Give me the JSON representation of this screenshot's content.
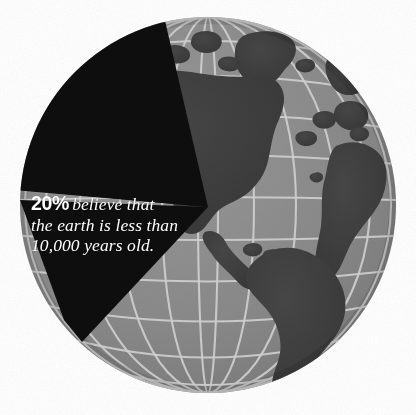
{
  "figure": {
    "name": "globe-pie-infographic",
    "background_color": "#ffffff",
    "globe": {
      "center_x": 208,
      "center_y": 205,
      "radius": 188,
      "ocean_color": "#8a8a8a",
      "land_color": "#3f3f3f",
      "grid_color": "#d2d2d2",
      "grid_meridians": 12,
      "grid_parallels": 11,
      "label": "Earth globe centered on the Americas"
    },
    "wedge": {
      "label": "20% pie wedge",
      "color": "#0e0e0e",
      "percent_value": 20,
      "apex_x": 208,
      "apex_y": 207,
      "start_angle_deg": 185,
      "end_angle_deg": 257
    }
  },
  "callout": {
    "percent": "20%",
    "line1_rest": "believe that",
    "line2": "the earth is less than",
    "line3": "10,000 years old.",
    "full_text": "20% believe that the earth is less than 10,000 years old.",
    "text_color": "#ffffff"
  },
  "chart_data": {
    "type": "pie",
    "categories": [
      "Believe the earth is less than 10,000 years old",
      "Other"
    ],
    "values": [
      20,
      80
    ],
    "value_labels": [
      "20%",
      "80%"
    ],
    "colors": [
      "#0e0e0e",
      "#8a8a8a"
    ],
    "unit": "percent",
    "legend": "none",
    "annotations": [
      "20% believe that the earth is less than 10,000 years old."
    ]
  }
}
